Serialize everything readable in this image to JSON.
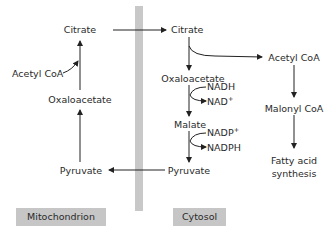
{
  "diagram": {
    "type": "metabolic-pathway",
    "compartments": [
      {
        "id": "mito",
        "label": "Mitochondrion"
      },
      {
        "id": "cyto",
        "label": "Cytosol"
      }
    ],
    "mitochondrion": {
      "citrate": "Citrate",
      "acetyl_coa": "Acetyl CoA",
      "oxaloacetate": "Oxaloacetate",
      "pyruvate": "Pyruvate"
    },
    "cytosol": {
      "citrate": "Citrate",
      "oxaloacetate": "Oxaloacetate",
      "nadh": "NADH",
      "nad": "NAD",
      "nad_sup": "+",
      "malate": "Malate",
      "nadp": "NADP",
      "nadp_sup": "+",
      "nadph": "NADPH",
      "pyruvate": "Pyruvate",
      "acetyl_coa": "Acetyl CoA",
      "malonyl_coa": "Malonyl CoA",
      "fatty_acid_line1": "Fatty acid",
      "fatty_acid_line2": "synthesis"
    },
    "edges": [
      {
        "from": "Citrate (mito)",
        "to": "Citrate (cyto)"
      },
      {
        "from": "Citrate (cyto)",
        "to": "Oxaloacetate (cyto)"
      },
      {
        "from": "Citrate (cyto)",
        "to": "Acetyl CoA (cyto)"
      },
      {
        "from": "Oxaloacetate (cyto)",
        "to": "Malate",
        "cofactor_in": "NADH",
        "cofactor_out": "NAD+"
      },
      {
        "from": "Malate",
        "to": "Pyruvate (cyto)",
        "cofactor_in": "NADP+",
        "cofactor_out": "NADPH"
      },
      {
        "from": "Pyruvate (cyto)",
        "to": "Pyruvate (mito)"
      },
      {
        "from": "Pyruvate (mito)",
        "to": "Oxaloacetate (mito)"
      },
      {
        "from": "Oxaloacetate (mito)",
        "to": "Citrate (mito)",
        "joins": "Acetyl CoA"
      },
      {
        "from": "Acetyl CoA (cyto)",
        "to": "Malonyl CoA"
      },
      {
        "from": "Malonyl CoA",
        "to": "Fatty acid synthesis"
      }
    ],
    "colors": {
      "line": "#222222",
      "divider": "#c8c8c8",
      "label_box": "#c6c6c6"
    }
  }
}
